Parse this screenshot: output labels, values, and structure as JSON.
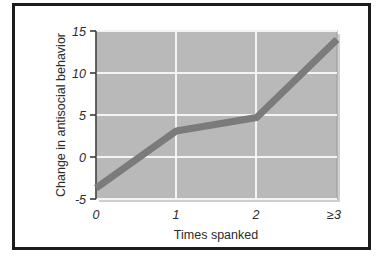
{
  "figure": {
    "border_color": "#1c1c1c",
    "background": "#ffffff"
  },
  "chart_data": {
    "type": "line",
    "title": "",
    "xlabel": "Times spanked",
    "ylabel": "Change in antisocial behavior",
    "categories": [
      "0",
      "1",
      "2",
      "≥3"
    ],
    "values": [
      -3.7,
      3.1,
      4.7,
      14.0
    ],
    "series": [
      {
        "name": "Change in antisocial behavior",
        "values": [
          -3.7,
          3.1,
          4.7,
          14.0
        ]
      }
    ],
    "ylim": [
      -5,
      15
    ],
    "yticks": [
      "15",
      "10",
      "5",
      "0",
      "-5"
    ],
    "ytick_values": [
      15,
      10,
      5,
      0,
      -5
    ],
    "xticks": [
      "0",
      "1",
      "2",
      "≥3"
    ],
    "grid": true,
    "grid_color": "#f2f2f2",
    "legend": "none",
    "plot_background": "#b9b9b9",
    "line_color": "#7b7b7b",
    "line_width": 7
  },
  "axes": {
    "y_title": "Change in antisocial behavior",
    "x_title": "Times spanked",
    "y_tick_15": "15",
    "y_tick_10": "10",
    "y_tick_5": "5",
    "y_tick_0": "0",
    "y_tick_neg5": "-5",
    "x_tick_0": "0",
    "x_tick_1": "1",
    "x_tick_2": "2",
    "x_tick_3": "≥3"
  }
}
